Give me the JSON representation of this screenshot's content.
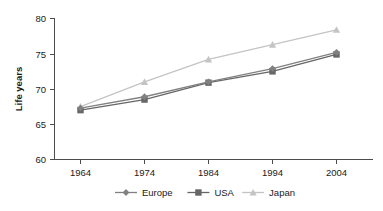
{
  "chart_data": {
    "type": "line",
    "title": "",
    "xlabel": "",
    "ylabel": "Life years",
    "categories": [
      "1964",
      "1974",
      "1984",
      "1994",
      "2004"
    ],
    "x": [
      1964,
      1974,
      1984,
      1994,
      2004
    ],
    "ylim": [
      60,
      80
    ],
    "yticks": [
      60,
      65,
      70,
      75,
      80
    ],
    "ytick_labels": [
      "60",
      "65",
      "70",
      "75",
      "80"
    ],
    "grid": false,
    "legend_position": "bottom",
    "series": [
      {
        "name": "Europe",
        "marker": "diamond",
        "color": "#808080",
        "values": [
          67.3,
          68.9,
          71.0,
          72.9,
          75.2
        ]
      },
      {
        "name": "USA",
        "marker": "square",
        "color": "#666666",
        "values": [
          67.0,
          68.5,
          70.9,
          72.5,
          74.9
        ]
      },
      {
        "name": "Japan",
        "marker": "triangle",
        "color": "#c4c4c4",
        "values": [
          67.5,
          71.0,
          74.2,
          76.3,
          78.4
        ]
      }
    ]
  },
  "axis": {
    "ylabel": "Life years",
    "ytick_0": "60",
    "ytick_1": "65",
    "ytick_2": "70",
    "ytick_3": "75",
    "ytick_4": "80",
    "xtick_0": "1964",
    "xtick_1": "1974",
    "xtick_2": "1984",
    "xtick_3": "1994",
    "xtick_4": "2004"
  },
  "legend": {
    "entry_0": "Europe",
    "entry_1": "USA",
    "entry_2": "Japan"
  },
  "colors": {
    "europe": "#808080",
    "usa": "#666666",
    "japan": "#c4c4c4",
    "axis": "#4d4d4d",
    "text": "#1a1a1a",
    "background": "#ffffff"
  }
}
